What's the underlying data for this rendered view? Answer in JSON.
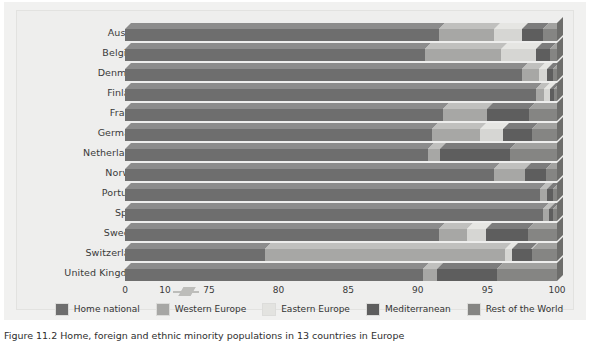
{
  "figure": {
    "caption": "Figure 11.2  Home, foreign and ethnic minority populations in 13 countries in Europe"
  },
  "axis": {
    "ticks": [
      "0",
      "10",
      "75",
      "80",
      "85",
      "90",
      "95",
      "100"
    ],
    "break_symbol": "axis-break"
  },
  "legend": {
    "items": [
      {
        "label": "Home national",
        "color": "#6e6e6e"
      },
      {
        "label": "Western Europe",
        "color": "#a7a7a5"
      },
      {
        "label": "Eastern Europe",
        "color": "#e3e3e0"
      },
      {
        "label": "Mediterranean",
        "color": "#5e5e5e"
      },
      {
        "label": "Rest of the World",
        "color": "#858583"
      }
    ]
  },
  "chart_data": {
    "type": "bar",
    "title": "Home, foreign and ethnic minority populations in 13 countries in Europe",
    "orientation": "horizontal",
    "stacked": true,
    "xlabel": "",
    "ylabel": "",
    "xlim": [
      0,
      100
    ],
    "axis_break": {
      "after": 10,
      "resume": 75
    },
    "xticks": [
      0,
      10,
      75,
      80,
      85,
      90,
      95,
      100
    ],
    "grid": false,
    "legend_position": "bottom",
    "categories": [
      "Austria",
      "Belgium",
      "Denmark",
      "Finland",
      "France",
      "Germany",
      "Netherlands",
      "Norway",
      "Portugal",
      "Spain",
      "Sweden",
      "Switzerland",
      "United Kingdom"
    ],
    "series": [
      {
        "name": "Home national",
        "color": "#6e6e6e",
        "values": [
          91.5,
          90.5,
          97.5,
          98.5,
          91.8,
          91.0,
          90.7,
          95.5,
          98.8,
          99.0,
          91.5,
          79.0,
          90.4
        ]
      },
      {
        "name": "Western Europe",
        "color": "#a7a7a5",
        "values": [
          4.0,
          5.5,
          1.2,
          0.6,
          3.2,
          3.5,
          0.9,
          2.2,
          0.5,
          0.4,
          2.0,
          17.3,
          1.0
        ]
      },
      {
        "name": "Eastern Europe",
        "color": "#e3e3e0",
        "values": [
          2.0,
          2.5,
          0.6,
          0.4,
          0.0,
          1.6,
          0.0,
          0.0,
          0.0,
          0.0,
          1.4,
          0.5,
          0.0
        ]
      },
      {
        "name": "Mediterranean",
        "color": "#5e5e5e",
        "values": [
          1.5,
          1.0,
          0.4,
          0.3,
          3.0,
          2.1,
          5.0,
          1.5,
          0.4,
          0.3,
          3.0,
          1.4,
          4.3
        ]
      },
      {
        "name": "Rest of the World",
        "color": "#858583",
        "values": [
          1.0,
          0.5,
          0.3,
          0.2,
          2.0,
          1.8,
          3.4,
          0.8,
          0.3,
          0.3,
          2.1,
          1.8,
          4.3
        ]
      }
    ]
  }
}
